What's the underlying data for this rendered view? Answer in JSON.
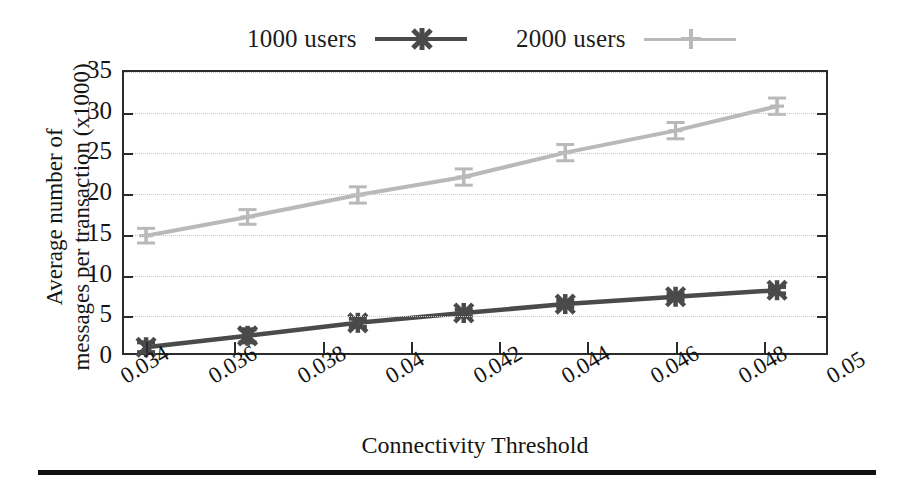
{
  "chart_data": {
    "type": "line",
    "title": "",
    "xlabel": "Connectivity Threshold",
    "ylabel": "Average number of messages per transaction (x1000)",
    "xlim": [
      0.0335,
      0.0495
    ],
    "ylim": [
      0,
      35
    ],
    "xticks": [
      "0.034",
      "0.036",
      "0.038",
      "0.04",
      "0.042",
      "0.044",
      "0.046",
      "0.048",
      "0.05"
    ],
    "xtick_values": [
      0.034,
      0.036,
      0.038,
      0.04,
      0.042,
      0.044,
      0.046,
      0.048,
      0.05
    ],
    "yticks": [
      "0",
      "5",
      "10",
      "15",
      "20",
      "25",
      "30",
      "35"
    ],
    "ytick_values": [
      0,
      5,
      10,
      15,
      20,
      25,
      30,
      35
    ],
    "grid": true,
    "legend_position": "above-plot",
    "x": [
      0.034,
      0.0363,
      0.0388,
      0.0412,
      0.0435,
      0.046,
      0.0483
    ],
    "series": [
      {
        "name": "1000 users",
        "color": "#4a4a4a",
        "marker": "cross-x",
        "values": [
          1.2,
          2.6,
          4.2,
          5.4,
          6.5,
          7.4,
          8.2
        ],
        "errors": [
          0.6,
          0.8,
          0.5,
          0.4,
          0.4,
          0.4,
          0.4
        ]
      },
      {
        "name": "2000 users",
        "color": "#b9b9b9",
        "marker": "plus",
        "values": [
          14.9,
          17.2,
          19.9,
          22.1,
          25.1,
          27.8,
          30.8
        ],
        "errors": [
          0.9,
          0.9,
          1.0,
          1.0,
          1.0,
          1.0,
          1.0
        ]
      }
    ]
  },
  "legend": {
    "entries": [
      {
        "label": "1000 users"
      },
      {
        "label": "2000 users"
      }
    ]
  },
  "axes": {
    "x_title": "Connectivity Threshold",
    "y_title_line1": "Average number of",
    "y_title_line2": "messages per transaction (x1000)"
  },
  "colors": {
    "series_1000": "#4a4a4a",
    "series_2000": "#b9b9b9",
    "axis": "#2b2b2b",
    "grid": "#c8c8c8",
    "rule": "#111111"
  }
}
